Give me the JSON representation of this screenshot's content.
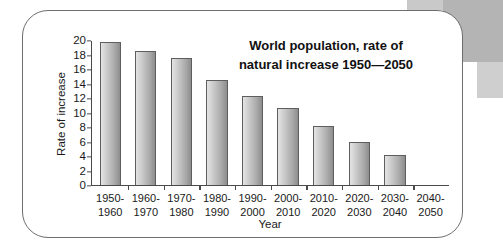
{
  "chart_data": {
    "type": "bar",
    "title_line1": "World population, rate of",
    "title_line2": "natural increase 1950—2050",
    "xlabel": "Year",
    "ylabel": "Rate of increase",
    "ylim": [
      0,
      20
    ],
    "y_ticks": [
      0,
      2,
      4,
      6,
      8,
      10,
      12,
      14,
      16,
      18,
      20
    ],
    "grid": false,
    "legend": null,
    "categories": [
      "1950–1960",
      "1960–1970",
      "1970–1980",
      "1980–1990",
      "1990–2000",
      "2000–2010",
      "2010–2020",
      "2020–2030",
      "2030–2040",
      "2040–2050"
    ],
    "category_lines": [
      [
        "1950-",
        "1960"
      ],
      [
        "1960-",
        "1970"
      ],
      [
        "1970-",
        "1980"
      ],
      [
        "1980-",
        "1990"
      ],
      [
        "1990-",
        "2000"
      ],
      [
        "2000-",
        "2010"
      ],
      [
        "2010-",
        "2020"
      ],
      [
        "2020-",
        "2030"
      ],
      [
        "2030-",
        "2040"
      ],
      [
        "2040-",
        "2050"
      ]
    ],
    "values": [
      19.9,
      18.6,
      17.7,
      14.6,
      12.3,
      10.7,
      8.1,
      5.9,
      4.1,
      null
    ],
    "bar_colors": {
      "gradient_light": "#e4e4e4",
      "gradient_dark": "#8d8d8d",
      "outline": "#5e5e5e"
    },
    "axis_color": "#4a4a4a",
    "text_color": "#1a1a1a"
  },
  "card": {
    "border_color": "#6e6e6e",
    "background": "#ffffff"
  },
  "decoration": {
    "band_color": "#b4b4b4"
  }
}
